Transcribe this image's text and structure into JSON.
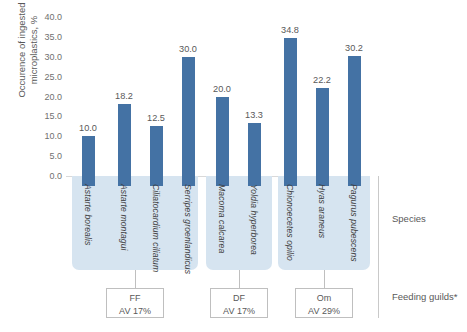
{
  "chart_data": {
    "type": "bar",
    "title": "",
    "xlabel": "Species",
    "ylabel": "Occurence of ingested\nmicroplastics, %",
    "ylim": [
      0,
      40
    ],
    "ytick_labels": [
      "40.0",
      "35.0",
      "30.0",
      "25.0",
      "20.0",
      "15.0",
      "10.0",
      "5.0",
      "0.0"
    ],
    "ytick_values": [
      40,
      35,
      30,
      25,
      20,
      15,
      10,
      5,
      0
    ],
    "grid": false,
    "legend": "none",
    "bar_color": "#4472A4",
    "panel_color": "#D6E4F0",
    "categories": [
      "Astarte borealis",
      "Astarte montagui",
      "Ciliatocardium ciliatum",
      "Serripes groenlandicus",
      "Macoma calcarea",
      "Yoldia hyperborea",
      "Chionoecetes opilio",
      "Hyas araneus",
      "Pagurus pubescens"
    ],
    "values": [
      10.0,
      18.2,
      12.5,
      30.0,
      20.0,
      13.3,
      34.8,
      22.2,
      30.2
    ],
    "value_labels": [
      "10.0",
      "18.2",
      "12.5",
      "30.0",
      "20.0",
      "13.3",
      "34.8",
      "22.2",
      "30.2"
    ],
    "groups": [
      {
        "code": "FF",
        "average_label": "AV 17%",
        "species": [
          "Astarte borealis",
          "Astarte montagui",
          "Ciliatocardium ciliatum",
          "Serripes groenlandicus"
        ]
      },
      {
        "code": "DF",
        "average_label": "AV 17%",
        "species": [
          "Macoma calcarea",
          "Yoldia hyperborea"
        ]
      },
      {
        "code": "Om",
        "average_label": "AV 29%",
        "species": [
          "Chionoecetes opilio",
          "Hyas araneus",
          "Pagurus pubescens"
        ]
      }
    ]
  },
  "side_labels": {
    "species": "Species",
    "feeding_guilds": "Feeding guilds*"
  }
}
